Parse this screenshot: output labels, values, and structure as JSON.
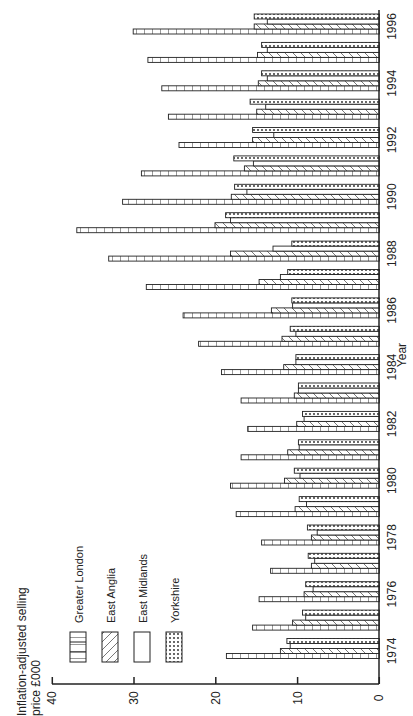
{
  "chart_data": {
    "type": "bar",
    "orientation": "rotated-90-counterclockwise",
    "title": "",
    "ylabel": "Inflation-adjusted selling price £000",
    "ylabel_lines": [
      "Inflation-adjusted selling",
      "price £000"
    ],
    "xlabel": "Year",
    "ylim": [
      0,
      40
    ],
    "yticks": [
      0,
      10,
      20,
      30,
      40
    ],
    "grid": false,
    "legend_position": "upper-left (rotated)",
    "categories": [
      "1974",
      "1975",
      "1976",
      "1977",
      "1978",
      "1979",
      "1980",
      "1981",
      "1982",
      "1983",
      "1984",
      "1985",
      "1986",
      "1987",
      "1988",
      "1989",
      "1990",
      "1991",
      "1992",
      "1993",
      "1994",
      "1995",
      "1996"
    ],
    "category_tick_labels": [
      "1974",
      "1976",
      "1978",
      "1980",
      "1982",
      "1984",
      "1986",
      "1988",
      "1990",
      "1992",
      "1994",
      "1996"
    ],
    "series": [
      {
        "name": "Greater London",
        "pattern": "vertical-lines",
        "values": [
          18.7,
          15.5,
          14.7,
          13.3,
          14.4,
          17.5,
          18.2,
          16.9,
          16.1,
          16.9,
          19.3,
          22.1,
          24.0,
          28.5,
          33.1,
          37.0,
          31.4,
          29.1,
          24.5,
          25.8,
          26.6,
          28.3,
          30.1
        ]
      },
      {
        "name": "East Anglia",
        "pattern": "diagonal-lines",
        "values": [
          12.1,
          10.6,
          9.2,
          8.3,
          8.3,
          10.3,
          11.6,
          11.2,
          10.1,
          10.4,
          11.7,
          11.9,
          13.2,
          14.7,
          18.2,
          20.1,
          18.1,
          16.5,
          15.5,
          15.0,
          14.8,
          14.9,
          15.3
        ]
      },
      {
        "name": "East Midlands",
        "pattern": "blank",
        "values": [
          10.9,
          9.0,
          8.1,
          7.9,
          7.6,
          8.9,
          9.7,
          9.8,
          9.2,
          9.9,
          10.2,
          10.2,
          10.6,
          12.1,
          13.0,
          18.2,
          16.2,
          15.4,
          12.9,
          13.9,
          13.7,
          13.7,
          13.7
        ]
      },
      {
        "name": "Yorkshire",
        "pattern": "dots",
        "values": [
          11.3,
          9.4,
          9.0,
          8.7,
          8.8,
          9.8,
          10.4,
          9.9,
          9.4,
          9.9,
          10.2,
          10.9,
          10.7,
          11.2,
          10.7,
          18.8,
          17.7,
          17.8,
          15.5,
          15.8,
          14.4,
          14.4,
          15.3
        ]
      }
    ]
  },
  "legend": {
    "items": [
      {
        "label": "Greater London",
        "pattern": "vertical-lines"
      },
      {
        "label": "East Anglia",
        "pattern": "diagonal-lines"
      },
      {
        "label": "East Midlands",
        "pattern": "blank"
      },
      {
        "label": "Yorkshire",
        "pattern": "dots"
      }
    ]
  },
  "colors": {
    "ink": "#222222",
    "background": "#ffffff"
  }
}
